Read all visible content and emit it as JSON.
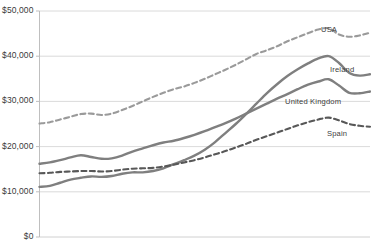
{
  "chart_data": {
    "type": "line",
    "title": "",
    "subtitle": "",
    "xlabel": "",
    "ylabel": "",
    "ylim": [
      0,
      50000
    ],
    "xlim": [
      0,
      32
    ],
    "grid": true,
    "legend_position": "inline-right-of-series",
    "y_ticks": [
      "$0",
      "$10,000",
      "$20,000",
      "$30,000",
      "$40,000",
      "$50,000"
    ],
    "y_tick_values": [
      0,
      10000,
      20000,
      30000,
      40000,
      50000
    ],
    "x_ticks": [],
    "x": [
      0,
      1,
      2,
      3,
      4,
      5,
      6,
      7,
      8,
      9,
      10,
      11,
      12,
      13,
      14,
      15,
      16,
      17,
      18,
      19,
      20,
      21,
      22,
      23,
      24,
      25,
      26,
      27,
      28,
      29,
      30,
      31,
      32
    ],
    "series": [
      {
        "name": "USA",
        "style": "dashed",
        "color": "#9a9a9a",
        "values": [
          25100,
          25400,
          26000,
          26600,
          27200,
          27300,
          27000,
          27300,
          28100,
          29000,
          30000,
          31000,
          31900,
          32700,
          33300,
          34100,
          35000,
          36000,
          37000,
          38100,
          39300,
          40500,
          41300,
          42200,
          43300,
          44200,
          45100,
          45900,
          46200,
          44800,
          44300,
          44600,
          45200
        ]
      },
      {
        "name": "Ireland",
        "style": "solid",
        "color": "#7f7f7f",
        "values": [
          11100,
          11300,
          12000,
          12700,
          13100,
          13400,
          13300,
          13500,
          14000,
          14300,
          14300,
          14600,
          15200,
          16100,
          17000,
          18000,
          19300,
          21000,
          23000,
          25000,
          27200,
          29500,
          31800,
          33800,
          35600,
          37100,
          38400,
          39500,
          40000,
          38500,
          36300,
          35700,
          36000
        ]
      },
      {
        "name": "United Kingdom",
        "style": "solid",
        "color": "#7f7f7f",
        "values": [
          16200,
          16500,
          17000,
          17600,
          18100,
          17700,
          17300,
          17400,
          18000,
          18900,
          19600,
          20300,
          20900,
          21300,
          21900,
          22600,
          23400,
          24300,
          25200,
          26200,
          27300,
          28400,
          29500,
          30600,
          31600,
          32700,
          33700,
          34400,
          34900,
          33500,
          31900,
          31800,
          32200
        ]
      },
      {
        "name": "Spain",
        "style": "dashed",
        "color": "#585858",
        "values": [
          14100,
          14200,
          14400,
          14500,
          14600,
          14600,
          14500,
          14600,
          14900,
          15100,
          15200,
          15300,
          15600,
          16000,
          16500,
          17000,
          17600,
          18300,
          19000,
          19800,
          20600,
          21500,
          22300,
          23100,
          23900,
          24700,
          25400,
          26000,
          26400,
          25800,
          25000,
          24600,
          24400
        ]
      }
    ],
    "series_labels": [
      {
        "name": "USA",
        "x": 321,
        "y": 25
      },
      {
        "name": "Ireland",
        "x": 330,
        "y": 65
      },
      {
        "name": "United Kingdom",
        "x": 285,
        "y": 97
      },
      {
        "name": "Spain",
        "x": 327,
        "y": 129
      }
    ],
    "axis_color": "#bfbfbf",
    "grid_color": "#d0d0d0",
    "text_color": "#3a3a3a"
  }
}
